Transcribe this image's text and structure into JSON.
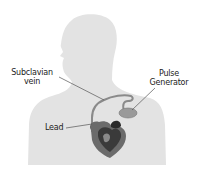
{
  "diagram": {
    "type": "anatomical-illustration",
    "labels": {
      "subclavian_line1": "Subclavian",
      "subclavian_line2": "vein",
      "pulse_line1": "Pulse",
      "pulse_line2": "Generator",
      "lead": "Lead"
    },
    "colors": {
      "background": "#ffffff",
      "silhouette": "#e3e3e3",
      "lead_wire": "#8a8a8a",
      "heart_dark": "#3a3a3a",
      "heart_mid": "#6b6b6b",
      "generator": "#9a9a9a",
      "leader_line": "#555555",
      "text": "#222222"
    }
  }
}
